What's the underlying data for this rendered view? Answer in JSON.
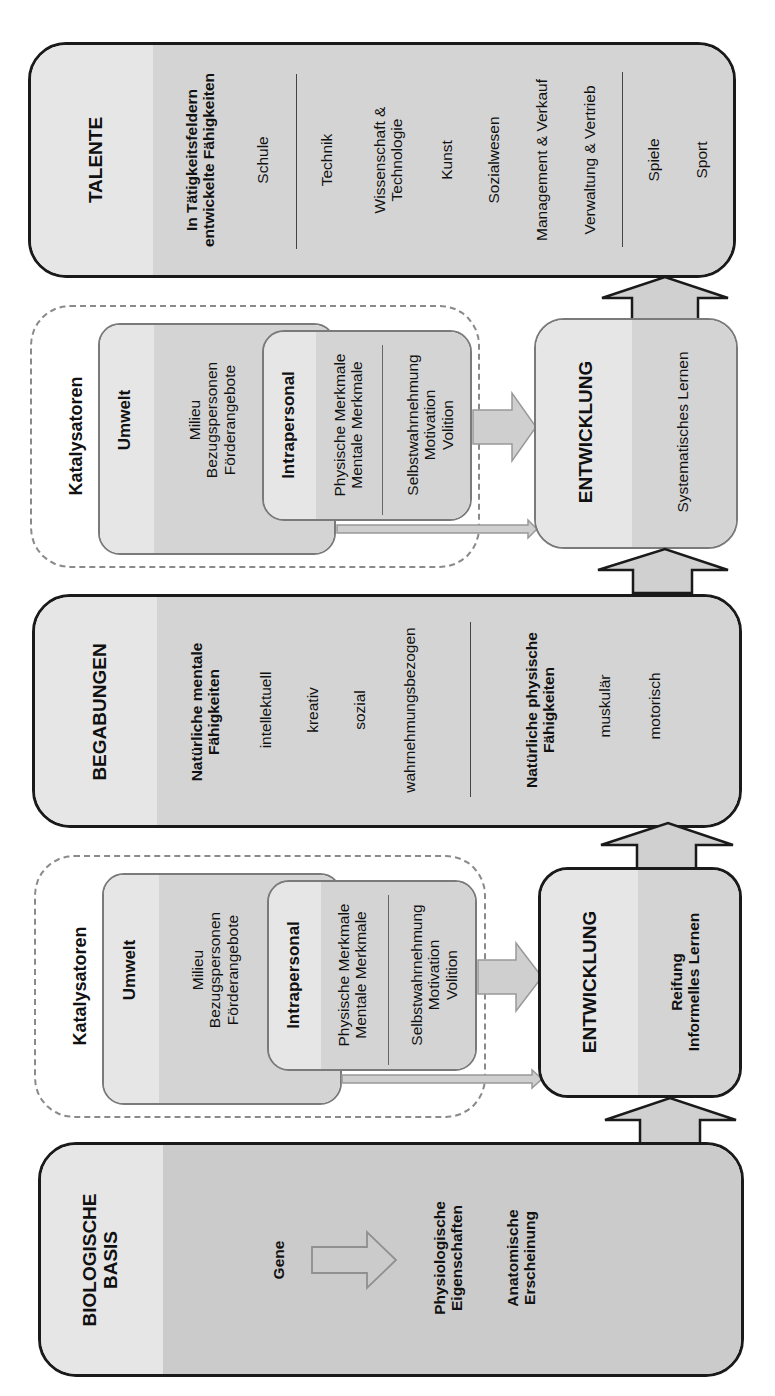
{
  "talente": {
    "title": "TALENTE",
    "subtitle_line1": "In Tätigkeitsfeldern",
    "subtitle_line2": "entwickelte Fähigkeiten",
    "items_group1": [
      "Schule"
    ],
    "items_group2": [
      "Technik",
      "Wissenschaft &",
      "Technologie",
      "Kunst",
      "Sozialwesen",
      "Management & Verkauf",
      "Verwaltung & Vertrieb"
    ],
    "items_group3": [
      "Spiele",
      "Sport"
    ]
  },
  "catalysts_upper": {
    "group_label": "Katalysatoren",
    "umwelt": {
      "title": "Umwelt",
      "items": [
        "Milieu",
        "Bezugspersonen",
        "Förderangebote"
      ]
    },
    "intrapersonal": {
      "title": "Intrapersonal",
      "items_a": [
        "Physische Merkmale",
        "Mentale Merkmale"
      ],
      "items_b": [
        "Selbstwahrnehmung",
        "Motivation",
        "Volition"
      ]
    }
  },
  "development_upper": {
    "title": "ENTWICKLUNG",
    "process": "Systematisches Lernen"
  },
  "begabungen": {
    "title": "BEGABUNGEN",
    "mental_title_line1": "Natürliche mentale",
    "mental_title_line2": "Fähigkeiten",
    "mental_items": [
      "intellektuell",
      "kreativ",
      "sozial",
      "wahrnehmungsbezogen"
    ],
    "physical_title_line1": "Natürliche physische",
    "physical_title_line2": "Fähigkeiten",
    "physical_items": [
      "muskulär",
      "motorisch"
    ]
  },
  "catalysts_lower": {
    "group_label": "Katalysatoren",
    "umwelt": {
      "title": "Umwelt",
      "items": [
        "Milieu",
        "Bezugspersonen",
        "Förderangebote"
      ]
    },
    "intrapersonal": {
      "title": "Intrapersonal",
      "items_a": [
        "Physische Merkmale",
        "Mentale Merkmale"
      ],
      "items_b": [
        "Selbstwahrnehmung",
        "Motivation",
        "Volition"
      ]
    }
  },
  "development_lower": {
    "title": "ENTWICKLUNG",
    "process_line1": "Reifung",
    "process_line2": "Informelles Lernen"
  },
  "biologische_basis": {
    "title_line1": "BIOLOGISCHE",
    "title_line2": "BASIS",
    "source": "Gene",
    "result1_line1": "Physiologische",
    "result1_line2": "Eigenschaften",
    "result2_line1": "Anatomische",
    "result2_line2": "Erscheinung"
  },
  "colors": {
    "header_fill": "#e6e6e6",
    "body_fill": "#d4d4d4",
    "bio_body_fill": "#cbcbcb",
    "stroke": "#1a1a1a",
    "gray_stroke": "#7a7a7a",
    "arrow_fill": "#d0d0d0"
  }
}
